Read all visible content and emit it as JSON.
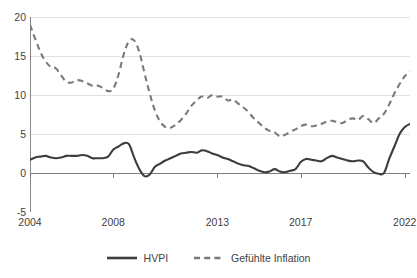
{
  "chart_data": {
    "type": "line",
    "title": "",
    "subtitle": "",
    "xlabel": "",
    "ylabel": "",
    "xlim": [
      2004,
      2022.25
    ],
    "ylim": [
      -5,
      20
    ],
    "yticks": [
      20,
      15,
      10,
      5,
      0,
      -5
    ],
    "ytick_labels": [
      "20",
      "15",
      "10",
      "5",
      "0",
      "-5"
    ],
    "xticks": [
      2004,
      2008,
      2013,
      2017,
      2022
    ],
    "xtick_labels": [
      "2004",
      "2008",
      "2013",
      "2017",
      "2022"
    ],
    "grid": "horizontal",
    "legend_position": "bottom-center",
    "colors": {
      "hvpi": "#3d3d3d",
      "gefuehlte_inflation": "#7a7a7a",
      "gridline": "#e2e2e2",
      "axis": "#7d7d7d",
      "background": "#ffffff"
    },
    "x": [
      2004.0,
      2004.25,
      2004.5,
      2004.75,
      2005.0,
      2005.25,
      2005.5,
      2005.75,
      2006.0,
      2006.25,
      2006.5,
      2006.75,
      2007.0,
      2007.25,
      2007.5,
      2007.75,
      2008.0,
      2008.25,
      2008.5,
      2008.75,
      2009.0,
      2009.25,
      2009.5,
      2009.75,
      2010.0,
      2010.25,
      2010.5,
      2010.75,
      2011.0,
      2011.25,
      2011.5,
      2011.75,
      2012.0,
      2012.25,
      2012.5,
      2012.75,
      2013.0,
      2013.25,
      2013.5,
      2013.75,
      2014.0,
      2014.25,
      2014.5,
      2014.75,
      2015.0,
      2015.25,
      2015.5,
      2015.75,
      2016.0,
      2016.25,
      2016.5,
      2016.75,
      2017.0,
      2017.25,
      2017.5,
      2017.75,
      2018.0,
      2018.25,
      2018.5,
      2018.75,
      2019.0,
      2019.25,
      2019.5,
      2019.75,
      2020.0,
      2020.25,
      2020.5,
      2020.75,
      2021.0,
      2021.25,
      2021.5,
      2021.75,
      2022.0,
      2022.25
    ],
    "series": [
      {
        "name": "HVPI",
        "style": "solid",
        "color": "#3d3d3d",
        "values": [
          1.7,
          2.0,
          2.1,
          2.2,
          2.0,
          1.9,
          2.0,
          2.2,
          2.2,
          2.2,
          2.3,
          2.2,
          1.9,
          1.9,
          1.9,
          2.1,
          3.0,
          3.4,
          3.8,
          3.7,
          2.0,
          0.5,
          -0.4,
          -0.2,
          0.8,
          1.2,
          1.6,
          1.9,
          2.2,
          2.5,
          2.6,
          2.7,
          2.6,
          2.9,
          2.8,
          2.5,
          2.3,
          2.0,
          1.8,
          1.5,
          1.2,
          1.0,
          0.9,
          0.6,
          0.3,
          0.1,
          0.2,
          0.5,
          0.2,
          0.1,
          0.3,
          0.5,
          1.4,
          1.8,
          1.7,
          1.6,
          1.5,
          1.9,
          2.2,
          2.0,
          1.8,
          1.6,
          1.5,
          1.6,
          1.5,
          0.7,
          0.1,
          -0.1,
          0.0,
          1.8,
          3.4,
          5.0,
          5.9,
          6.3
        ]
      },
      {
        "name": "Gefühlte Inflation",
        "style": "dashed",
        "color": "#7a7a7a",
        "values": [
          19.0,
          17.2,
          15.5,
          14.3,
          13.6,
          13.4,
          12.5,
          11.7,
          11.6,
          11.9,
          11.8,
          11.5,
          11.2,
          11.2,
          10.9,
          10.5,
          10.8,
          12.6,
          15.2,
          16.9,
          17.0,
          15.5,
          12.8,
          10.2,
          8.0,
          6.6,
          5.9,
          5.8,
          6.2,
          6.8,
          7.6,
          8.6,
          9.3,
          9.8,
          9.6,
          10.0,
          9.8,
          9.8,
          9.3,
          9.4,
          8.9,
          8.4,
          7.8,
          7.0,
          6.4,
          5.8,
          5.4,
          5.2,
          4.7,
          4.9,
          5.3,
          5.6,
          6.0,
          6.2,
          6.0,
          6.1,
          6.3,
          6.6,
          6.7,
          6.5,
          6.4,
          6.8,
          7.0,
          6.8,
          7.3,
          6.9,
          6.4,
          7.0,
          7.6,
          8.8,
          10.2,
          11.4,
          12.4,
          13.0
        ]
      }
    ]
  },
  "legend": {
    "items": [
      {
        "label": "HVPI",
        "style": "solid"
      },
      {
        "label": "Gefühlte Inflation",
        "style": "dashed"
      }
    ]
  }
}
